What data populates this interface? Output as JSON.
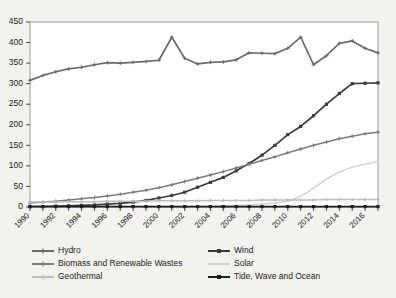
{
  "chart_data": {
    "type": "line",
    "title": "",
    "xlabel": "",
    "ylabel": "",
    "ylim": [
      0,
      450
    ],
    "ytick_step": 50,
    "yticks": [
      0,
      50,
      100,
      150,
      200,
      250,
      300,
      350,
      400,
      450
    ],
    "grid": false,
    "legend_position": "bottom",
    "legend_columns": 2,
    "x": [
      1990,
      1991,
      1992,
      1993,
      1994,
      1995,
      1996,
      1997,
      1998,
      1999,
      2000,
      2001,
      2002,
      2003,
      2004,
      2005,
      2006,
      2007,
      2008,
      2009,
      2010,
      2011,
      2012,
      2013,
      2014,
      2015,
      2016,
      2017
    ],
    "xtick_labels": [
      "1990",
      "1992",
      "1994",
      "1996",
      "1998",
      "2000",
      "2002",
      "2004",
      "2006",
      "2008",
      "2010",
      "2012",
      "2014",
      "2016"
    ],
    "xtick_label_years": [
      1990,
      1992,
      1994,
      1996,
      1998,
      2000,
      2002,
      2004,
      2006,
      2008,
      2010,
      2012,
      2014,
      2016
    ],
    "xtick_rotation": -45,
    "series": [
      {
        "name": "Hydro",
        "color": "#6b6b6b",
        "marker": "plus",
        "values": [
          308,
          320,
          329,
          336,
          340,
          346,
          351,
          350,
          352,
          354,
          357,
          413,
          362,
          348,
          352,
          353,
          358,
          375,
          374,
          373,
          386,
          413,
          346,
          368,
          398,
          404,
          386,
          375
        ]
      },
      {
        "name": "Wind",
        "color": "#3b3b3b",
        "marker": "square",
        "values": [
          1,
          1,
          2,
          3,
          4,
          5,
          7,
          9,
          12,
          16,
          22,
          28,
          36,
          48,
          60,
          72,
          88,
          106,
          126,
          150,
          176,
          196,
          222,
          250,
          276,
          300,
          301,
          302
        ]
      },
      {
        "name": "Biomass and Renewable Wastes",
        "color": "#7c7c7c",
        "marker": "plus",
        "values": [
          10,
          12,
          14,
          17,
          20,
          23,
          27,
          31,
          36,
          41,
          47,
          54,
          62,
          70,
          78,
          86,
          95,
          104,
          113,
          122,
          132,
          141,
          150,
          158,
          166,
          172,
          178,
          182
        ]
      },
      {
        "name": "Solar",
        "color": "#d2d2d2",
        "marker": "none",
        "values": [
          0,
          0,
          0,
          0,
          0,
          0,
          0,
          0,
          0,
          1,
          1,
          1,
          1,
          2,
          2,
          3,
          4,
          5,
          7,
          10,
          14,
          26,
          46,
          68,
          85,
          97,
          104,
          110
        ]
      },
      {
        "name": "Geothermal",
        "color": "#bdbdbd",
        "marker": "plus",
        "values": [
          12,
          12,
          12,
          13,
          13,
          13,
          14,
          14,
          14,
          14,
          15,
          15,
          15,
          15,
          16,
          16,
          16,
          16,
          17,
          17,
          17,
          17,
          17,
          18,
          18,
          18,
          18,
          18
        ]
      },
      {
        "name": "Tide, Wave and Ocean",
        "color": "#1e1e1e",
        "marker": "square",
        "values": [
          1,
          1,
          1,
          1,
          1,
          1,
          1,
          1,
          1,
          1,
          1,
          1,
          1,
          1,
          1,
          1,
          1,
          1,
          1,
          1,
          1,
          1,
          1,
          1,
          1,
          1,
          1,
          1
        ]
      }
    ]
  },
  "legend": {
    "entries": [
      {
        "label": "Hydro",
        "color": "#6b6b6b",
        "marker": "plus"
      },
      {
        "label": "Wind",
        "color": "#3b3b3b",
        "marker": "square"
      },
      {
        "label": "Biomass and Renewable Wastes",
        "color": "#7c7c7c",
        "marker": "plus"
      },
      {
        "label": "Solar",
        "color": "#d2d2d2",
        "marker": "none"
      },
      {
        "label": "Geothermal",
        "color": "#bdbdbd",
        "marker": "plus"
      },
      {
        "label": "Tide, Wave and Ocean",
        "color": "#1e1e1e",
        "marker": "square"
      }
    ]
  },
  "colors": {
    "background": "#f4f2ef",
    "plot_area": "#ffffff",
    "frame": "#9a9a9a",
    "text": "#1b1b1b"
  }
}
